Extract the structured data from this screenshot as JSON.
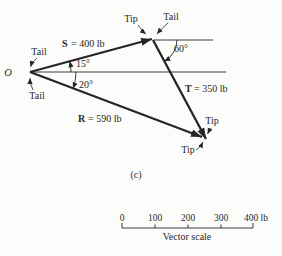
{
  "colors": {
    "paper": "#fcfcfa",
    "ink": "#262626"
  },
  "diagram": {
    "caption": "(c)",
    "origin_label": "O",
    "vectors": {
      "s": {
        "symbol": "S",
        "value": "= 400 lb",
        "magnitude_lb": 400,
        "angle_from_horizontal": "15°"
      },
      "t": {
        "symbol": "T",
        "value": "= 350 lb",
        "magnitude_lb": 350,
        "angle_from_horizontal": "60°"
      },
      "r": {
        "symbol": "R",
        "value": "= 590 lb",
        "magnitude_lb": 590,
        "angle_from_horizontal": "20°"
      }
    },
    "point_labels": {
      "tip_top": "Tip",
      "tail_top": "Tail",
      "tail_upper_left": "Tail",
      "tail_lower_left": "Tail",
      "tip_t": "Tip",
      "tip_r": "Tip"
    }
  },
  "scale_bar": {
    "tick_labels": [
      "0",
      "100",
      "200",
      "300",
      "400 lb"
    ],
    "caption": "Vector scale"
  }
}
